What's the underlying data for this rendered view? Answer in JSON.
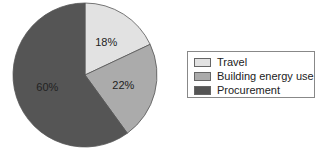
{
  "chart_data": {
    "type": "pie",
    "title": "",
    "categories": [
      "Travel",
      "Building energy use",
      "Procurement"
    ],
    "values": [
      18,
      22,
      60
    ],
    "labels": [
      "18%",
      "22%",
      "60%"
    ],
    "colors": [
      "#e2e2e2",
      "#ababab",
      "#555555"
    ],
    "start_angle_deg": 0,
    "direction": "clockwise",
    "legend_position": "right"
  },
  "legend": {
    "items": [
      {
        "label": "Travel",
        "color": "#e2e2e2"
      },
      {
        "label": "Building energy use",
        "color": "#ababab"
      },
      {
        "label": "Procurement",
        "color": "#555555"
      }
    ]
  }
}
